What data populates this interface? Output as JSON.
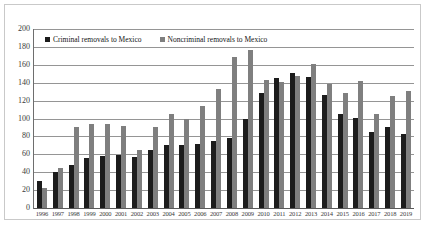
{
  "chart_data": {
    "type": "bar",
    "title": "",
    "xlabel": "",
    "ylabel": "",
    "ylim": [
      0,
      200
    ],
    "ytick_step": 20,
    "yticks": [
      200,
      180,
      160,
      140,
      120,
      100,
      80,
      60,
      40,
      20,
      0
    ],
    "grid": true,
    "legend_position": "top-left-inside",
    "categories": [
      "1996",
      "1997",
      "1998",
      "1999",
      "2000",
      "2001",
      "2002",
      "2003",
      "2004",
      "2005",
      "2006",
      "2007",
      "2008",
      "2009",
      "2010",
      "2011",
      "2012",
      "2013",
      "2014",
      "2015",
      "2016",
      "2017",
      "2018",
      "2019"
    ],
    "series": [
      {
        "name": "Criminal removals to Mexico",
        "color": "#1c1c1c",
        "values": [
          30,
          40,
          48,
          56,
          58,
          59,
          57,
          65,
          70,
          70,
          72,
          75,
          78,
          99,
          128,
          145,
          151,
          146,
          126,
          105,
          101,
          85,
          91,
          83
        ]
      },
      {
        "name": "Noncriminal removals to Mexico",
        "color": "#7f7f7f",
        "values": [
          22,
          45,
          91,
          94,
          94,
          92,
          65,
          90,
          105,
          99,
          114,
          133,
          169,
          176,
          143,
          141,
          148,
          161,
          139,
          129,
          142,
          105,
          125,
          131
        ]
      }
    ]
  },
  "legend": {
    "entries": [
      {
        "label": "Criminal removals to Mexico"
      },
      {
        "label": "Noncriminal removals to Mexico"
      }
    ]
  },
  "colors": {
    "criminal": "#1c1c1c",
    "noncriminal": "#7f7f7f",
    "gridline": "#959595",
    "frame": "#c9c9c9",
    "background": "#ffffff"
  }
}
